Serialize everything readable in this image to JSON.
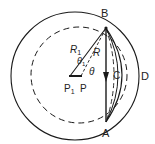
{
  "diagram": {
    "labels": {
      "B": "B",
      "A": "A",
      "C": "C",
      "D": "D",
      "R1": "R",
      "R1_sub": "1",
      "R": "R",
      "theta1": "θ",
      "theta1_sub": "1",
      "theta": "θ",
      "P1": "P",
      "P1_sub": "1",
      "P": "P"
    },
    "colors": {
      "stroke": "#1a1a1a",
      "background": "#ffffff"
    }
  }
}
